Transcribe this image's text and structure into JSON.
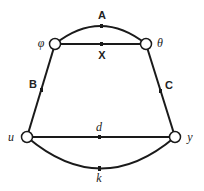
{
  "diagram": {
    "type": "graph",
    "nodes": [
      {
        "id": "phi",
        "label": "φ",
        "x": 55,
        "y": 44
      },
      {
        "id": "theta",
        "label": "θ",
        "x": 146,
        "y": 44
      },
      {
        "id": "u",
        "label": "u",
        "x": 27,
        "y": 137
      },
      {
        "id": "y",
        "label": "y",
        "x": 175,
        "y": 137
      }
    ],
    "edges": [
      {
        "id": "A",
        "label": "A",
        "from": "phi",
        "to": "theta",
        "shape": "arc-up"
      },
      {
        "id": "X",
        "label": "X",
        "from": "phi",
        "to": "theta",
        "shape": "straight"
      },
      {
        "id": "B",
        "label": "B",
        "from": "phi",
        "to": "u",
        "shape": "straight"
      },
      {
        "id": "C",
        "label": "C",
        "from": "theta",
        "to": "y",
        "shape": "straight"
      },
      {
        "id": "d",
        "label": "d",
        "from": "u",
        "to": "y",
        "shape": "straight"
      },
      {
        "id": "k",
        "label": "k",
        "from": "u",
        "to": "y",
        "shape": "arc-down"
      }
    ]
  },
  "labels": {
    "node_phi": "φ",
    "node_theta": "θ",
    "node_u": "u",
    "node_y": "y",
    "edge_A": "A",
    "edge_X": "X",
    "edge_B": "B",
    "edge_C": "C",
    "edge_d": "d",
    "edge_k": "k"
  },
  "colors": {
    "stroke": "#1a1a1a",
    "node_fill": "#ffffff",
    "background": "#ffffff"
  }
}
